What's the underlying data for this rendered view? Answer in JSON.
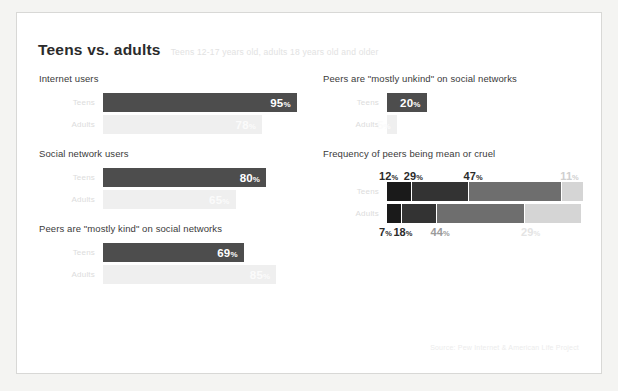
{
  "slide": {
    "title": "Teens vs. adults",
    "subtitle": "Teens 12-17 years old, adults 18 years old and older",
    "source": "Source: Pew Internet & American Life Project"
  },
  "labels": {
    "teens": "Teens",
    "adults": "Adults",
    "percent_symbol": "%"
  },
  "colors": {
    "teens_bar": "#4d4d4d",
    "adults_bar": "#efefef",
    "seg_1": "#1a1a1a",
    "seg_2": "#333333",
    "seg_3": "#6e6e6e",
    "seg_4": "#d5d5d5",
    "slide_background": "#ffffff",
    "page_background": "#f4f4f2"
  },
  "chart_data": [
    {
      "type": "bar",
      "title": "Internet users",
      "categories": [
        "Teens",
        "Adults"
      ],
      "values": [
        95,
        78
      ],
      "value_labels": [
        "95",
        "78"
      ],
      "xlabel": "",
      "ylabel": "",
      "xlim": [
        0,
        100
      ]
    },
    {
      "type": "bar",
      "title": "Social network users",
      "categories": [
        "Teens",
        "Adults"
      ],
      "values": [
        80,
        65
      ],
      "value_labels": [
        "80",
        "65"
      ],
      "xlabel": "",
      "ylabel": "",
      "xlim": [
        0,
        100
      ]
    },
    {
      "type": "bar",
      "title": "Peers are \"mostly kind\" on social networks",
      "categories": [
        "Teens",
        "Adults"
      ],
      "values": [
        69,
        85
      ],
      "value_labels": [
        "69",
        "85"
      ],
      "xlabel": "",
      "ylabel": "",
      "xlim": [
        0,
        100
      ]
    },
    {
      "type": "bar",
      "title": "Peers are \"mostly unkind\" on social networks",
      "categories": [
        "Teens",
        "Adults"
      ],
      "values": [
        20,
        5
      ],
      "value_labels": [
        "20",
        "5"
      ],
      "xlabel": "",
      "ylabel": "",
      "xlim": [
        0,
        100
      ]
    },
    {
      "type": "bar",
      "subtype": "stacked-horizontal",
      "title": "Frequency of peers being mean or cruel",
      "categories": [
        "Teens",
        "Adults"
      ],
      "series": [
        {
          "name": "Frequently",
          "values": [
            12,
            7
          ]
        },
        {
          "name": "Sometimes",
          "values": [
            29,
            18
          ]
        },
        {
          "name": "Rarely",
          "values": [
            47,
            44
          ]
        },
        {
          "name": "Never",
          "values": [
            11,
            29
          ]
        }
      ],
      "teens_labels": [
        "12",
        "29",
        "47",
        "11"
      ],
      "adults_labels": [
        "7",
        "18",
        "44",
        "29"
      ],
      "xlabel": "",
      "ylabel": "",
      "xlim": [
        0,
        100
      ]
    }
  ],
  "sections": {
    "internet_users": {
      "heading": "Internet users",
      "teens_value": "95",
      "adults_value": "78",
      "teens_pct": 95,
      "adults_pct": 78
    },
    "social_network_users": {
      "heading": "Social network users",
      "teens_value": "80",
      "adults_value": "65",
      "teens_pct": 80,
      "adults_pct": 65
    },
    "mostly_kind": {
      "heading": "Peers are \"mostly kind\" on social networks",
      "teens_value": "69",
      "adults_value": "85",
      "teens_pct": 69,
      "adults_pct": 85
    },
    "mostly_unkind": {
      "heading": "Peers are \"mostly unkind\" on social networks",
      "teens_value": "20",
      "adults_value": "5",
      "teens_pct": 20,
      "adults_pct": 5
    },
    "mean_or_cruel": {
      "heading": "Frequency of peers being mean or cruel",
      "teens": [
        "12",
        "29",
        "47",
        "11"
      ],
      "adults": [
        "7",
        "18",
        "44",
        "29"
      ]
    }
  }
}
